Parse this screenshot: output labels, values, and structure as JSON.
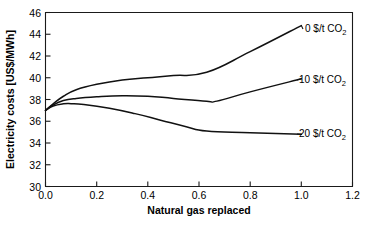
{
  "chart_data": {
    "type": "line",
    "title": "",
    "xlabel": "Natural gas replaced",
    "ylabel": "Electricity costs [US$/MWh]",
    "xlim": [
      0.0,
      1.2
    ],
    "ylim": [
      30,
      46
    ],
    "grid": false,
    "legend_position": "inline-right-annotations",
    "xticks": [
      "0.0",
      "0.2",
      "0.4",
      "0.6",
      "0.8",
      "1.0",
      "1.2"
    ],
    "xtick_values": [
      0.0,
      0.2,
      0.4,
      0.6,
      0.8,
      1.0,
      1.2
    ],
    "yticks": [
      "30",
      "32",
      "34",
      "36",
      "38",
      "40",
      "42",
      "44",
      "46"
    ],
    "ytick_values": [
      30,
      32,
      34,
      36,
      38,
      40,
      42,
      44,
      46
    ],
    "series": [
      {
        "name": "0 $/t CO2",
        "label_text": "0 $/t CO",
        "label_sub": "2",
        "x": [
          0.0,
          0.03,
          0.07,
          0.12,
          0.2,
          0.3,
          0.4,
          0.5,
          0.63,
          0.8,
          1.0
        ],
        "values": [
          37.0,
          37.6,
          38.3,
          38.9,
          39.4,
          39.8,
          40.0,
          40.2,
          40.5,
          42.4,
          44.8
        ]
      },
      {
        "name": "10 $/t CO2",
        "label_text": "10 $/t CO",
        "label_sub": "2",
        "x": [
          0.0,
          0.03,
          0.07,
          0.12,
          0.2,
          0.3,
          0.4,
          0.5,
          0.63,
          0.67,
          0.8,
          1.0
        ],
        "values": [
          37.0,
          37.5,
          37.9,
          38.1,
          38.25,
          38.35,
          38.3,
          38.1,
          37.85,
          37.85,
          38.7,
          39.9
        ]
      },
      {
        "name": "20 $/t CO2",
        "label_text": "20 $/t CO",
        "label_sub": "2",
        "x": [
          0.0,
          0.03,
          0.07,
          0.1,
          0.15,
          0.25,
          0.35,
          0.45,
          0.55,
          0.63,
          0.8,
          1.0
        ],
        "values": [
          37.0,
          37.4,
          37.6,
          37.62,
          37.55,
          37.2,
          36.7,
          36.1,
          35.5,
          35.1,
          34.95,
          34.8
        ]
      }
    ],
    "annotations": [
      {
        "text": "0 $/t CO2",
        "x": 1.0,
        "y": 44.8
      },
      {
        "text": "10 $/t CO2",
        "x": 1.0,
        "y": 39.9
      },
      {
        "text": "20 $/t CO2",
        "x": 1.0,
        "y": 34.8
      }
    ]
  },
  "axis": {
    "y_title": "Electricity costs [US$/MWh]",
    "x_title": "Natural gas replaced"
  }
}
